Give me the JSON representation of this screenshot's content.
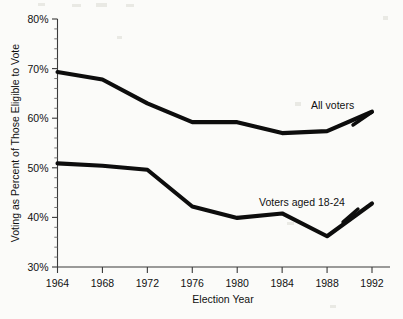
{
  "chart_data": {
    "type": "line",
    "title": "",
    "subtitle": "",
    "xlabel": "Election Year",
    "ylabel": "Voting as Percent of Those Eligible to Vote",
    "x": [
      1964,
      1968,
      1972,
      1976,
      1980,
      1984,
      1988,
      1992
    ],
    "categories": [
      "1964",
      "1968",
      "1972",
      "1976",
      "1980",
      "1984",
      "1988",
      "1992"
    ],
    "xlim": [
      1964,
      1992
    ],
    "ylim": [
      30,
      80
    ],
    "y_tick_labels": [
      "30%",
      "40%",
      "50%",
      "60%",
      "70%",
      "80%"
    ],
    "y_tick_values": [
      30,
      40,
      50,
      60,
      70,
      80
    ],
    "y_minor_step": 2,
    "grid": false,
    "legend_position": "inline-annotation",
    "series": [
      {
        "name": "All voters",
        "values": [
          69.3,
          67.8,
          63.0,
          59.2,
          59.2,
          57.0,
          57.4,
          61.3
        ],
        "color": "#0d0d0d",
        "label": "All voters"
      },
      {
        "name": "Voters aged 18-24",
        "values": [
          50.9,
          50.4,
          49.6,
          42.2,
          39.9,
          40.8,
          36.2,
          42.8
        ],
        "color": "#0d0d0d",
        "label": "Voters aged 18-24"
      }
    ],
    "annotations": [
      {
        "text": "All voters",
        "x": 1986.5,
        "y": 65.5
      },
      {
        "text": "Voters aged 18-24",
        "x": 1984.0,
        "y": 45.8
      }
    ]
  },
  "axes": {
    "y_title": "Voting as Percent of Those Eligible to Vote",
    "x_title": "Election Year"
  },
  "colors": {
    "line": "#0d0d0d",
    "axis": "#3a3a3a",
    "background": "#fbfbf9",
    "text": "#111111"
  }
}
